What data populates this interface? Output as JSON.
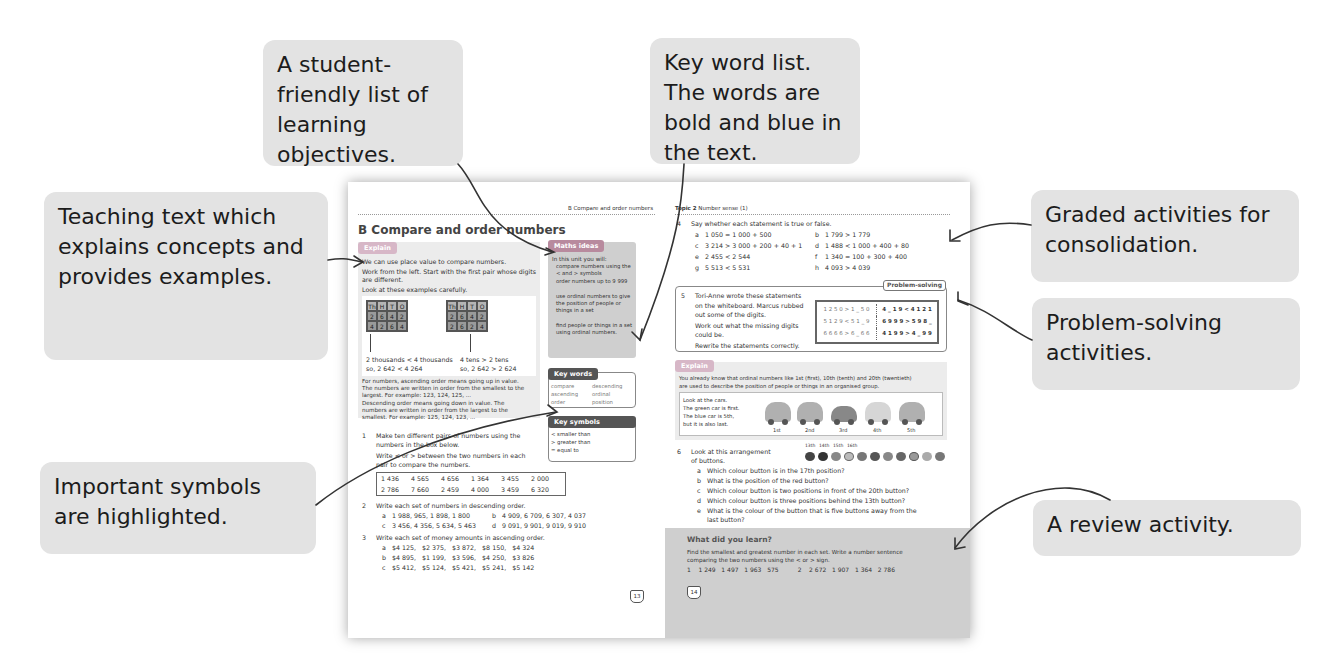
{
  "callouts": {
    "objectives": "A student-friendly list of learning objectives.",
    "key_words": "Key word list. The words are bold and blue in the text.",
    "teaching_text": "Teaching text which explains concepts and provides examples.",
    "symbols": "Important symbols are highlighted.",
    "graded": "Graded activities for consolidation.",
    "problem_solving": "Problem-solving activities.",
    "review": "A review activity."
  },
  "left_page": {
    "running_head": "B Compare and order numbers",
    "title": "B  Compare and order numbers",
    "explain_tag": "Explain",
    "explain_lines": [
      "We can use place value to compare numbers.",
      "Work from the left. Start with the first pair whose digits",
      "are different.",
      "Look at these examples carefully."
    ],
    "pv_headers": [
      "Th",
      "H",
      "T",
      "O"
    ],
    "pv_table_1": [
      [
        "2",
        "6",
        "4",
        "2"
      ],
      [
        "4",
        "2",
        "6",
        "4"
      ]
    ],
    "pv_table_2": [
      [
        "2",
        "6",
        "4",
        "2"
      ],
      [
        "2",
        "6",
        "2",
        "4"
      ]
    ],
    "compare_1": [
      "2 thousands < 4 thousands",
      "so, 2 642 < 4 264"
    ],
    "compare_2": [
      "4 tens > 2 tens",
      "so, 2 642 > 2 624"
    ],
    "ascending_text": [
      "For numbers, ascending order means going up in value.",
      "The numbers are written in order from the smallest to the",
      "largest. For example: 123, 124, 125, ..."
    ],
    "descending_text": [
      "Descending order means going down in value. The",
      "numbers are written in order from the largest to the",
      "smallest. For example: 125, 124, 123, ..."
    ],
    "maths_ideas": {
      "tag": "Maths ideas",
      "intro": "In this unit you will:",
      "items": [
        "compare numbers using the < and > symbols",
        "order numbers up to 9 999",
        "use ordinal numbers to give the position of people or things in a set",
        "find people or things in a set using ordinal numbers."
      ]
    },
    "key_words": {
      "tag": "Key words",
      "words": [
        "compare",
        "descending",
        "ascending",
        "ordinal",
        "order",
        "position"
      ]
    },
    "key_symbols": {
      "tag": "Key symbols",
      "items": [
        "< smaller than",
        "> greater than",
        "= equal to"
      ]
    },
    "q1": {
      "num": "1",
      "lines": [
        "Make ten different pairs of numbers using the",
        "numbers in the box below.",
        "Write < or > between the two numbers in each",
        "pair to compare the numbers."
      ],
      "numbers": [
        "1 436",
        "4 565",
        "4 656",
        "1 364",
        "3 455",
        "2 000",
        "2 786",
        "7 660",
        "2 459",
        "4 000",
        "3 459",
        "6 320"
      ]
    },
    "q2": {
      "num": "2",
      "prompt": "Write each set of numbers in descending order.",
      "parts": [
        {
          "label": "a",
          "text": "1 988, 965, 1 898, 1 800"
        },
        {
          "label": "b",
          "text": "4 909, 6 709, 6 307, 4 037"
        },
        {
          "label": "c",
          "text": "3 456, 4 356, 5 634, 5 463"
        },
        {
          "label": "d",
          "text": "9 091, 9 901, 9 019, 9 910"
        }
      ]
    },
    "q3": {
      "num": "3",
      "prompt": "Write each set of money amounts in ascending order.",
      "parts": [
        {
          "label": "a",
          "text": "$4 125,   $2 375,   $3 872,   $8 150,   $4 324"
        },
        {
          "label": "b",
          "text": "$4 895,   $1 199,   $3 596,   $4 250,   $3 826"
        },
        {
          "label": "c",
          "text": "$5 412,   $5 124,   $5 421,   $5 241,   $5 142"
        }
      ]
    },
    "page_number": "13"
  },
  "right_page": {
    "running_head_bold": "Topic 2",
    "running_head": " Number sense (1)",
    "q4": {
      "num": "4",
      "prompt": "Say whether each statement is true or false.",
      "parts": [
        {
          "label": "a",
          "text": "1 050 = 1 000 + 500"
        },
        {
          "label": "b",
          "text": "1 799 > 1 779"
        },
        {
          "label": "c",
          "text": "3 214 > 3 000 + 200 + 40 + 1"
        },
        {
          "label": "d",
          "text": "1 488 < 1 000 + 400 + 80"
        },
        {
          "label": "e",
          "text": "2 455 < 2 544"
        },
        {
          "label": "f",
          "text": "1 340 = 100 + 300 + 400"
        },
        {
          "label": "g",
          "text": "5 513 < 5 531"
        },
        {
          "label": "h",
          "text": "4 093 > 4 039"
        }
      ]
    },
    "problem_solving_tag": "Problem-solving",
    "q5": {
      "num": "5",
      "lines": [
        "Tori-Anne wrote these statements",
        "on the whiteboard. Marcus rubbed",
        "out some of the digits.",
        "Work out what the missing digits",
        "could be.",
        "Rewrite the statements correctly."
      ],
      "whiteboard": [
        "1 2 5 0 > 1 _ 5 0",
        "4 _ 1 9 < 4 1 2 1",
        "5 1 2 9 < 5 1 _ 9",
        "6 9 9 9 > 5 9 8 _",
        "6 6 6 6 > 6 _ 6 6",
        "4 1 9 9 > 4 _ 9 9"
      ]
    },
    "explain_tag": "Explain",
    "explain_lines": [
      "You already know that ordinal numbers like 1st (first), 10th (tenth) and 20th (twentieth)",
      "are used to describe the position of people or things in an organised group."
    ],
    "cars_text": [
      "Look at the cars.",
      "The green car is first.",
      "The blue car is 5th,",
      "but it is also last."
    ],
    "car_labels": [
      "1st",
      "2nd",
      "3rd",
      "4th",
      "5th"
    ],
    "q6": {
      "num": "6",
      "lines": [
        "Look at this arrangement",
        "of buttons."
      ],
      "button_labels": [
        "13th",
        "14th",
        "15th",
        "16th"
      ],
      "parts": [
        {
          "label": "a",
          "text": "Which colour button is in the 17th position?"
        },
        {
          "label": "b",
          "text": "What is the position of the red button?"
        },
        {
          "label": "c",
          "text": "Which colour button is two positions in front of the 20th button?"
        },
        {
          "label": "d",
          "text": "Which colour button is three positions behind the 13th button?"
        },
        {
          "label": "e",
          "text": "What is the colour of the button that is five buttons away from the"
        },
        {
          "label": "",
          "text": "last button?"
        }
      ]
    },
    "review": {
      "title": "What did you learn?",
      "lines": [
        "Find the smallest and greatest number in each set. Write a number sentence",
        "comparing the two numbers using the < or > sign."
      ],
      "sets": "1    1 249   1 497   1 963   575          2    2 672   1 907   1 364   2 786"
    },
    "page_number": "14"
  }
}
